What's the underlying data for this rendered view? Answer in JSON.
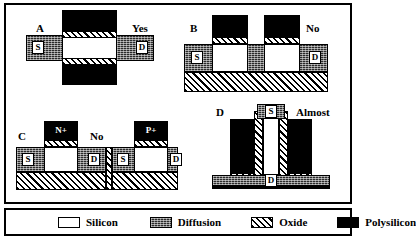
{
  "figure": {
    "border_color": "#000000",
    "background": "#ffffff"
  },
  "panels": [
    {
      "id": "A",
      "letter": "A",
      "verdict": "Yes",
      "view": "layout",
      "terminals": [
        {
          "name": "source",
          "label": "S"
        },
        {
          "name": "drain",
          "label": "D"
        }
      ],
      "layers": [
        "Polysilicon",
        "Oxide",
        "Silicon",
        "Diffusion"
      ]
    },
    {
      "id": "B",
      "letter": "B",
      "verdict": "No",
      "view": "cross-section",
      "terminals": [
        {
          "name": "source",
          "label": "S"
        },
        {
          "name": "drain",
          "label": "D"
        }
      ],
      "layers": [
        "Polysilicon",
        "Oxide",
        "Silicon",
        "Diffusion"
      ]
    },
    {
      "id": "C",
      "letter": "C",
      "verdict": "No",
      "view": "cross-section",
      "devices": [
        {
          "implant": "N+",
          "terminals": [
            {
              "name": "source",
              "label": "S"
            },
            {
              "name": "drain",
              "label": "D"
            }
          ]
        },
        {
          "implant": "P+",
          "terminals": [
            {
              "name": "source",
              "label": "S"
            },
            {
              "name": "drain",
              "label": "D"
            }
          ]
        }
      ],
      "layers": [
        "Polysilicon",
        "Oxide",
        "Silicon",
        "Diffusion"
      ]
    },
    {
      "id": "D",
      "letter": "D",
      "verdict": "Almost",
      "view": "vertical",
      "terminals": [
        {
          "name": "drain-outer",
          "label": "D"
        },
        {
          "name": "source-top",
          "label": "S"
        },
        {
          "name": "drain-bottom",
          "label": "D"
        }
      ],
      "layers": [
        "Polysilicon",
        "Oxide",
        "Silicon",
        "Diffusion"
      ]
    }
  ],
  "legend": {
    "items": [
      {
        "label": "Silicon",
        "swatch": "silicon-swatch",
        "color": "#ffffff",
        "pattern": "solid-white"
      },
      {
        "label": "Diffusion",
        "swatch": "diffusion-swatch",
        "color": "#2b2b2b",
        "pattern": "stipple"
      },
      {
        "label": "Oxide",
        "swatch": "oxide-swatch",
        "color": "#000000",
        "pattern": "diagonal-hatch"
      },
      {
        "label": "Polysilicon",
        "swatch": "polysilicon-swatch",
        "color": "#000000",
        "pattern": "solid-black"
      }
    ]
  }
}
